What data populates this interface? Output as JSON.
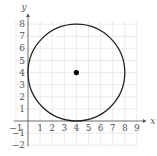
{
  "chart_data": {
    "type": "scatter",
    "title": "",
    "xlabel": "x",
    "ylabel": "y",
    "xlim": [
      -1,
      9
    ],
    "ylim": [
      -2,
      8
    ],
    "grid": true,
    "x_ticks": [
      "-1",
      "1",
      "2",
      "3",
      "4",
      "5",
      "6",
      "7",
      "8",
      "9"
    ],
    "y_ticks": [
      "8",
      "7",
      "6",
      "5",
      "4",
      "3",
      "2",
      "1",
      "-1",
      "-2"
    ],
    "shapes": [
      {
        "kind": "circle",
        "center": [
          4,
          4
        ],
        "radius": 4
      }
    ],
    "points": [
      {
        "x": 4,
        "y": 4,
        "label": "center"
      }
    ]
  },
  "colors": {
    "curve": "#222222",
    "grid": "#dddddd",
    "axis": "#555555"
  }
}
